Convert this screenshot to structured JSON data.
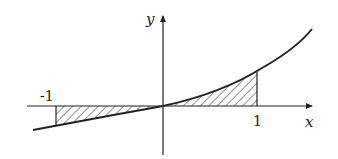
{
  "figure": {
    "type": "area-under-curve diagram",
    "axes": {
      "x_label": "x",
      "y_label": "y"
    },
    "tick_labels": {
      "left": "-1",
      "right": "1"
    },
    "curve": {
      "description": "increasing convex curve through origin",
      "passes_through_origin": true
    },
    "shaded_regions": [
      {
        "from": "-1",
        "to": "0",
        "position": "below x-axis"
      },
      {
        "from": "0",
        "to": "1",
        "position": "above x-axis"
      }
    ],
    "colors": {
      "stroke": "#222222",
      "background": "#ffffff"
    }
  }
}
